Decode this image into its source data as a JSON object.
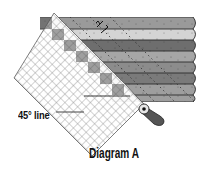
{
  "diagram": {
    "caption": "Diagram A",
    "line_label": "45° line",
    "strips": [
      {
        "index": 1,
        "left": 40,
        "top": 17,
        "bottom": 29,
        "color": "#9a9a9a"
      },
      {
        "index": 2,
        "left": 52,
        "top": 29,
        "bottom": 40,
        "color": "#d4d4d4"
      },
      {
        "index": 3,
        "left": 64,
        "top": 40,
        "bottom": 51,
        "color": "#6e6e6e"
      },
      {
        "index": 4,
        "left": 76,
        "top": 51,
        "bottom": 62,
        "color": "#a6a6a6"
      },
      {
        "index": 5,
        "left": 88,
        "top": 62,
        "bottom": 73,
        "color": "#8c8c8c"
      },
      {
        "index": 6,
        "left": 100,
        "top": 73,
        "bottom": 84,
        "color": "#7a7a7a"
      },
      {
        "index": 7,
        "left": 112,
        "top": 84,
        "bottom": 95,
        "color": "#9e9e9e"
      }
    ],
    "strip_right_edge": 195,
    "ruler": {
      "fill": "#ffffff",
      "grid_color": "#777777",
      "angle_deg": 45
    },
    "tool": {
      "name": "rotary-cutter",
      "handle_color": "#555555"
    },
    "colors": {
      "outline": "#333333",
      "text": "#111111"
    }
  }
}
